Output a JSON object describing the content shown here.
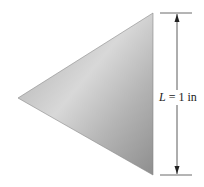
{
  "diagram": {
    "shape": "triangle",
    "dimension_label": {
      "variable": "L",
      "equals": " = 1 in"
    },
    "colors": {
      "fill_light": "#d6d6d6",
      "fill_dark": "#9a9a9a",
      "line": "#333333"
    }
  }
}
